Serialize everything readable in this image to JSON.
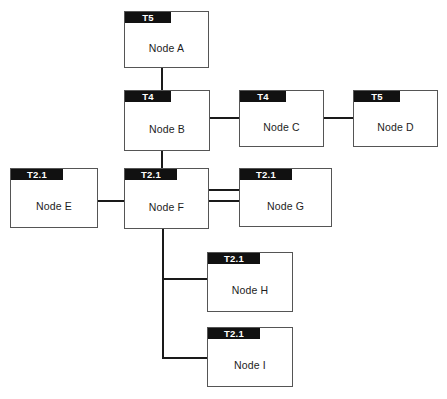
{
  "diagram": {
    "canvas": {
      "width": 447,
      "height": 399,
      "background": "#ffffff"
    },
    "colors": {
      "tag_background": "#111111",
      "tag_text": "#ffffff",
      "box_border": "#555555",
      "box_background": "#ffffff",
      "connector": "#1a1a1a",
      "label_text": "#1d1d1d"
    },
    "nodes": [
      {
        "id": "a",
        "tag": "T5",
        "label": "Node A",
        "x": 124,
        "y": 11,
        "w": 85,
        "h": 57,
        "tag_w": 46
      },
      {
        "id": "b",
        "tag": "T4",
        "label": "Node B",
        "x": 124,
        "y": 90,
        "w": 86,
        "h": 61,
        "tag_w": 46
      },
      {
        "id": "c",
        "tag": "T4",
        "label": "Node C",
        "x": 239,
        "y": 90,
        "w": 85,
        "h": 57,
        "tag_w": 46
      },
      {
        "id": "d",
        "tag": "T5",
        "label": "Node D",
        "x": 353,
        "y": 90,
        "w": 85,
        "h": 57,
        "tag_w": 46
      },
      {
        "id": "e",
        "tag": "T2.1",
        "label": "Node E",
        "x": 10,
        "y": 168,
        "w": 88,
        "h": 60,
        "tag_w": 52
      },
      {
        "id": "f",
        "tag": "T2.1",
        "label": "Node F",
        "x": 124,
        "y": 168,
        "w": 85,
        "h": 61,
        "tag_w": 52
      },
      {
        "id": "g",
        "tag": "T2.1",
        "label": "Node G",
        "x": 239,
        "y": 168,
        "w": 93,
        "h": 59,
        "tag_w": 52
      },
      {
        "id": "h",
        "tag": "T2.1",
        "label": "Node H",
        "x": 207,
        "y": 252,
        "w": 86,
        "h": 60,
        "tag_w": 52
      },
      {
        "id": "i",
        "tag": "T2.1",
        "label": "Node I",
        "x": 207,
        "y": 327,
        "w": 86,
        "h": 60,
        "tag_w": 52
      }
    ],
    "connectors": [
      {
        "id": "a-to-b",
        "from": "Node A",
        "to": "Node B",
        "orient": "v",
        "x": 161,
        "y": 68,
        "length": 22
      },
      {
        "id": "b-to-c",
        "from": "Node B",
        "to": "Node C",
        "orient": "h",
        "x": 209,
        "y": 117,
        "length": 31
      },
      {
        "id": "c-to-d",
        "from": "Node C",
        "to": "Node D",
        "orient": "h",
        "x": 323,
        "y": 117,
        "length": 31
      },
      {
        "id": "b-to-f",
        "from": "Node B",
        "to": "Node F",
        "orient": "v",
        "x": 161,
        "y": 150,
        "length": 19
      },
      {
        "id": "e-to-f",
        "from": "Node E",
        "to": "Node F",
        "orient": "h",
        "x": 97,
        "y": 200,
        "length": 28
      },
      {
        "id": "f-to-g-upper",
        "from": "Node F",
        "to": "Node G",
        "orient": "h",
        "x": 208,
        "y": 189,
        "length": 32
      },
      {
        "id": "f-to-g-lower",
        "from": "Node F",
        "to": "Node G",
        "orient": "h",
        "x": 208,
        "y": 200,
        "length": 32
      },
      {
        "id": "f-trunk",
        "from": "Node F",
        "to": "Node I",
        "orient": "v",
        "x": 162,
        "y": 228,
        "length": 131
      },
      {
        "id": "trunk-to-h",
        "from": "Node F",
        "to": "Node H",
        "orient": "h",
        "x": 162,
        "y": 278,
        "length": 46
      },
      {
        "id": "trunk-to-i",
        "from": "Node F",
        "to": "Node I",
        "orient": "h",
        "x": 162,
        "y": 357,
        "length": 46
      }
    ]
  }
}
